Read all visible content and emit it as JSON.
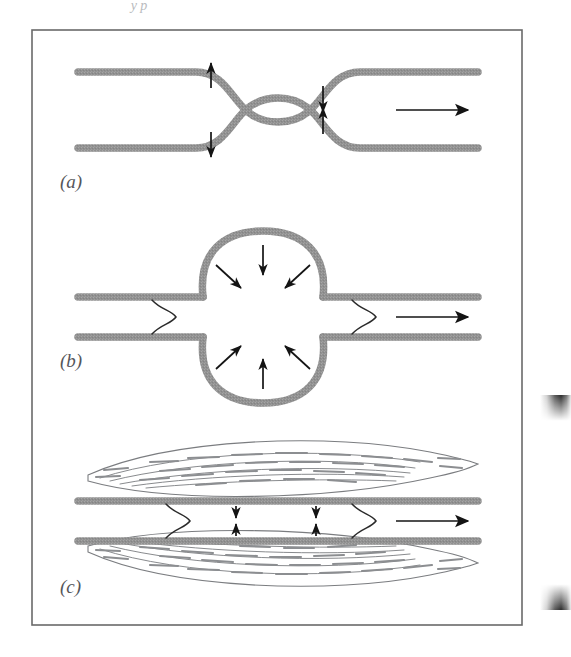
{
  "figure": {
    "domain": "scientific-illustration",
    "top_cut_text": "y p",
    "panels": [
      {
        "id": "a",
        "label": "(a)",
        "title": "Converging-diverging constriction",
        "geometry": "stenosis",
        "flow_arrow": "right",
        "arrow_groups": [
          {
            "name": "upstream-outward",
            "direction": "outward",
            "count": 2
          },
          {
            "name": "throat-inward",
            "direction": "inward",
            "count": 2
          }
        ]
      },
      {
        "id": "b",
        "label": "(b)",
        "title": "Spherical dilatation (aneurysm)",
        "geometry": "sphere",
        "flow_arrow": "right",
        "arrow_groups": [
          {
            "name": "radial-inward",
            "direction": "inward",
            "count": 6
          }
        ],
        "brace_marks": 2
      },
      {
        "id": "c",
        "label": "(c)",
        "title": "Straight tube with fibrous wall thickening",
        "geometry": "straight",
        "flow_arrow": "right",
        "arrow_groups": [
          {
            "name": "wall-inward",
            "direction": "inward",
            "count": 4
          }
        ],
        "brace_marks": 2,
        "plaque_masses": 2
      }
    ],
    "colors": {
      "wall": "#929292",
      "wall_shade": "#a8a8a8",
      "ink": "#1c1c1c",
      "border": "#6a6a6a",
      "label": "#55565a",
      "plaque_line": "#7b7d80",
      "background": "#ffffff",
      "gutter_shadow": "#2b2b2b"
    },
    "border": {
      "x": 32,
      "y": 30,
      "width": 490,
      "height": 595
    }
  }
}
